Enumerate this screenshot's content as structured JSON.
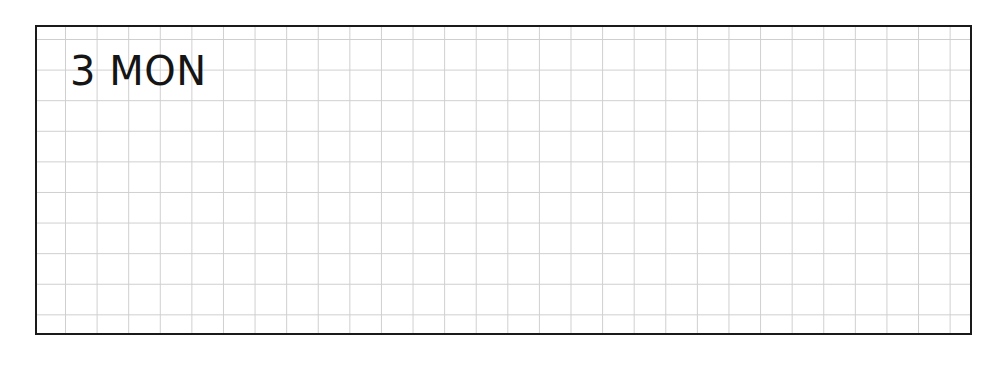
{
  "planner": {
    "day_label": "3 MON",
    "grid": {
      "columns_visible": 29,
      "rows_visible": 10,
      "line_color": "#cfcfcf",
      "border_color": "#1a1a1a"
    }
  }
}
